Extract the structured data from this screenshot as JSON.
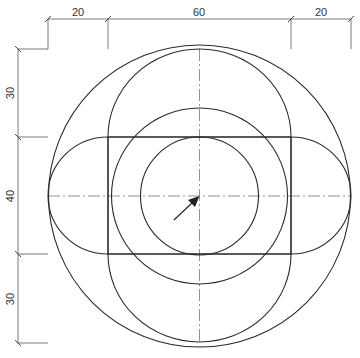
{
  "drawing": {
    "type": "technical-drawing",
    "units_per_px": 0.3406,
    "colors": {
      "geometry": "#2a2a2a",
      "dimension": "#555555",
      "text": "#333333",
      "background": "#ffffff"
    },
    "horizontal_dimensions": [
      {
        "label": "20",
        "from_x": 48,
        "to_x": 108
      },
      {
        "label": "60",
        "from_x": 108,
        "to_x": 291
      },
      {
        "label": "20",
        "from_x": 291,
        "to_x": 351
      }
    ],
    "vertical_dimensions": [
      {
        "label": "30",
        "from_y": 49,
        "to_y": 137
      },
      {
        "label": "40",
        "from_y": 137,
        "to_y": 254
      },
      {
        "label": "30",
        "from_y": 254,
        "to_y": 343
      }
    ],
    "geometry": {
      "center": {
        "x": 199.5,
        "y": 196
      },
      "outer_circle": {
        "diameter_units": 100,
        "r_px": 151
      },
      "middle_circle": {
        "diameter_units": 60,
        "r_px": 88
      },
      "inner_circle": {
        "diameter_units": 40,
        "r_px": 59
      },
      "rectangle": {
        "width_units": 60,
        "height_units": 40
      },
      "vertical_stadium": {
        "width_units": 60,
        "length_units": 100
      },
      "horizontal_stadium": {
        "height_units": 40,
        "length_units": 100
      }
    },
    "annotations": {
      "center_arrow": "arrow-pointing-to-center"
    }
  }
}
